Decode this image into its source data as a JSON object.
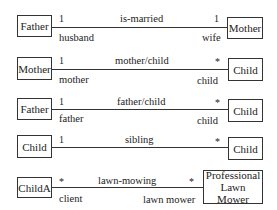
{
  "diagram": {
    "type": "UML association examples",
    "associations": [
      {
        "left": {
          "name": "Father",
          "multiplicity": "1",
          "role": "husband"
        },
        "right": {
          "name": "Mother",
          "multiplicity": "1",
          "role": "wife"
        },
        "label": "is-married"
      },
      {
        "left": {
          "name": "Mother",
          "multiplicity": "1",
          "role": "mother"
        },
        "right": {
          "name": "Child",
          "multiplicity": "*",
          "role": "child"
        },
        "label": "mother/child"
      },
      {
        "left": {
          "name": "Father",
          "multiplicity": "1",
          "role": "father"
        },
        "right": {
          "name": "Child",
          "multiplicity": "*",
          "role": "child"
        },
        "label": "father/child"
      },
      {
        "left": {
          "name": "Child",
          "multiplicity": "1",
          "role": ""
        },
        "right": {
          "name": "Child",
          "multiplicity": "*",
          "role": ""
        },
        "label": "sibling"
      },
      {
        "left": {
          "name": "ChildA",
          "multiplicity": "*",
          "role": "client"
        },
        "right": {
          "name": "Professional Lawn Mower",
          "multiplicity": "*",
          "role": "lawn mower"
        },
        "label": "lawn-mowing"
      }
    ]
  }
}
